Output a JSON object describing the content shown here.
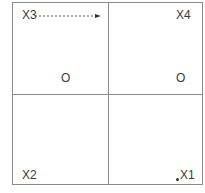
{
  "diagram": {
    "quadrants": {
      "top_left": {
        "label": "X3",
        "marker": "O"
      },
      "top_right": {
        "label": "X4",
        "marker": "O"
      },
      "bottom_left": {
        "label": "X2"
      },
      "bottom_right": {
        "label": "X1"
      }
    },
    "arrow": {
      "from": "X3",
      "to": "X4",
      "style": "dashed"
    },
    "colors": {
      "line": "#8a8a8a",
      "text": "#3a3a3a"
    }
  }
}
